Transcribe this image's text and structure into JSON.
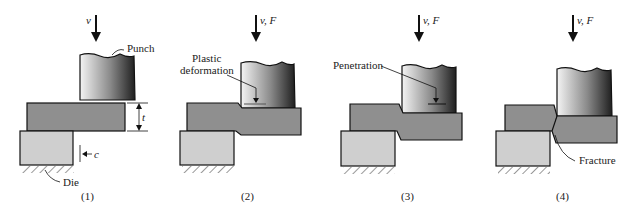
{
  "figure": {
    "panels": [
      {
        "id": "1",
        "caption": "(1)",
        "motion_label": "v",
        "labels": {
          "punch": "Punch",
          "thickness": "t",
          "clearance": "c",
          "die": "Die"
        }
      },
      {
        "id": "2",
        "caption": "(2)",
        "motion_label": "v, F",
        "labels": {
          "callout": "Plastic",
          "callout2": "deformation"
        }
      },
      {
        "id": "3",
        "caption": "(3)",
        "motion_label": "v, F",
        "labels": {
          "callout": "Penetration"
        }
      },
      {
        "id": "4",
        "caption": "(4)",
        "motion_label": "v, F",
        "labels": {
          "callout": "Fracture"
        }
      }
    ],
    "colors": {
      "sheet": "#8f8f8f",
      "die": "#cfcfcf",
      "outline": "#1a1a1a",
      "punch_light": "#f4f4f4",
      "punch_dark": "#1f1f1f"
    }
  }
}
